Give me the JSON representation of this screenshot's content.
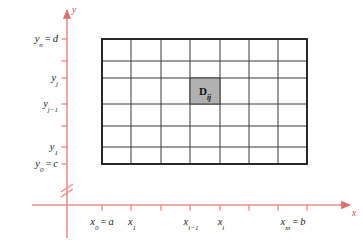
{
  "figure": {
    "colors": {
      "axis": "#e8908c",
      "axis_dark": "#c0514d",
      "grid_line": "#3a3a3a",
      "border": "#1c1c1c",
      "cell_fill": "#b0b0b0",
      "label": "#1b1b1b",
      "background": "#ffffff"
    }
  },
  "axes": {
    "x_label": "x",
    "y_label": "y",
    "has_break_y": true,
    "break_marks": 2
  },
  "y_ticks": [
    {
      "id": "y-tick-yn",
      "base": "y",
      "sub": "n",
      "eq": "=",
      "value": "d",
      "y": 39
    },
    {
      "id": "y-tick-yj",
      "base": "y",
      "sub": "j",
      "eq": "",
      "value": "",
      "y": 78
    },
    {
      "id": "y-tick-yj1",
      "base": "y",
      "sub": "j−1",
      "eq": "",
      "value": "",
      "y": 104
    },
    {
      "id": "y-tick-y1",
      "base": "y",
      "sub": "1",
      "eq": "",
      "value": "",
      "y": 147
    },
    {
      "id": "y-tick-y0",
      "base": "y",
      "sub": "0",
      "eq": "=",
      "value": "c",
      "y": 164
    }
  ],
  "y_tick_marks": [
    39,
    61,
    78,
    104,
    126,
    147,
    164
  ],
  "x_ticks": [
    {
      "id": "x-tick-x0",
      "base": "x",
      "sub": "0",
      "eq": "=",
      "value": "a",
      "x": 102
    },
    {
      "id": "x-tick-x1",
      "base": "x",
      "sub": "1",
      "eq": "",
      "value": "",
      "x": 132
    },
    {
      "id": "x-tick-xi1",
      "base": "x",
      "sub": "i−1",
      "eq": "",
      "value": "",
      "x": 191
    },
    {
      "id": "x-tick-xi",
      "base": "x",
      "sub": "i",
      "eq": "",
      "value": "",
      "x": 221
    },
    {
      "id": "x-tick-xm",
      "base": "x",
      "sub": "m",
      "eq": "=",
      "value": "b",
      "x": 293
    }
  ],
  "x_tick_marks": [
    102,
    131,
    161,
    190,
    220,
    249,
    278,
    307
  ],
  "grid": {
    "columns": 7,
    "rows": 6,
    "left": 102,
    "right": 307,
    "top": 39,
    "bottom": 164,
    "v_lines": [
      102,
      131,
      161,
      190,
      220,
      249,
      278,
      307
    ],
    "h_lines": [
      39,
      61,
      78,
      104,
      126,
      147,
      164
    ]
  },
  "highlighted_cell": {
    "label_base": "D",
    "label_sub": "ij",
    "col_index": 4,
    "row_index": 3,
    "x": 190,
    "y": 78,
    "width": 30,
    "height": 26,
    "center_x": 205,
    "center_y": 91
  },
  "axis_geometry": {
    "x_axis_y": 205,
    "y_axis_x": 67,
    "x_axis_start": 32,
    "x_axis_end": 350,
    "y_axis_top": 10,
    "y_axis_bottom": 238,
    "break_y": 188
  }
}
